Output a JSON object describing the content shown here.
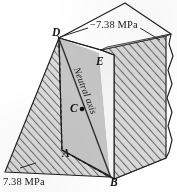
{
  "figure": {
    "type": "engineering-diagram",
    "background_color": "#ffffff",
    "ink_color": "#1a1a1a",
    "hatch_color": "#6f6f6f",
    "wedge_fill": "#d6d6d6",
    "section_fill": "#c9c9c9",
    "light_face_fill": "#f2f2f2",
    "stress_labels": {
      "compression": "−7.38 MPa",
      "tension": "7.38 MPa"
    },
    "neutral_axis_label": "Neutral axis",
    "points": [
      {
        "id": "point-a",
        "label": "A",
        "x": 62,
        "y": 154
      },
      {
        "id": "point-b",
        "label": "B",
        "x": 110,
        "y": 183
      },
      {
        "id": "point-c",
        "label": "C",
        "x": 72,
        "y": 108
      },
      {
        "id": "point-d",
        "label": "D",
        "x": 52,
        "y": 33
      },
      {
        "id": "point-e",
        "label": "E",
        "x": 96,
        "y": 62
      }
    ],
    "centroid_marker": {
      "id": "centroid-dot",
      "x": 82,
      "y": 109,
      "radius": 2.2
    }
  },
  "geometry": {
    "block_top_face": "59,38 125,3 171,34 101,50",
    "block_right_band": "171,34 169,46 173,60 169,78 172,96 168,118 172,136 169,152 166,158 114,179 114,55",
    "block_front_outline": "59,38 101,50 114,55 114,179 110,176 62,150",
    "tension_wedge": "59,38 62,150 108,176 5,172",
    "compression_wedge": "101,50 166,36 166,158 114,179 114,55",
    "section_face": "59,38 99,53 110,176 62,150",
    "light_face": "99,53 110,176 114,179 114,55",
    "neutral_axis_line": {
      "x1": 58,
      "y1": 36,
      "x2": 110,
      "y2": 177
    },
    "tear_edge": "171,34 169,44 173,56 168,70 172,84 167,98 172,112 168,126 172,140 169,152 166,158"
  }
}
